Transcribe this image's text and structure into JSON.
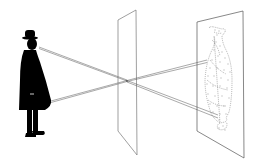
{
  "figure": {
    "type": "pinhole-camera-illustration",
    "elements": [
      "man-figure",
      "pinhole-pane",
      "projection-screen",
      "inverted-image",
      "light-rays"
    ]
  },
  "colors": {
    "background": "#ffffff",
    "figure": "#000000",
    "pane_stroke": "#777777",
    "ray_stroke": "#555555",
    "stipple": "#666666"
  }
}
